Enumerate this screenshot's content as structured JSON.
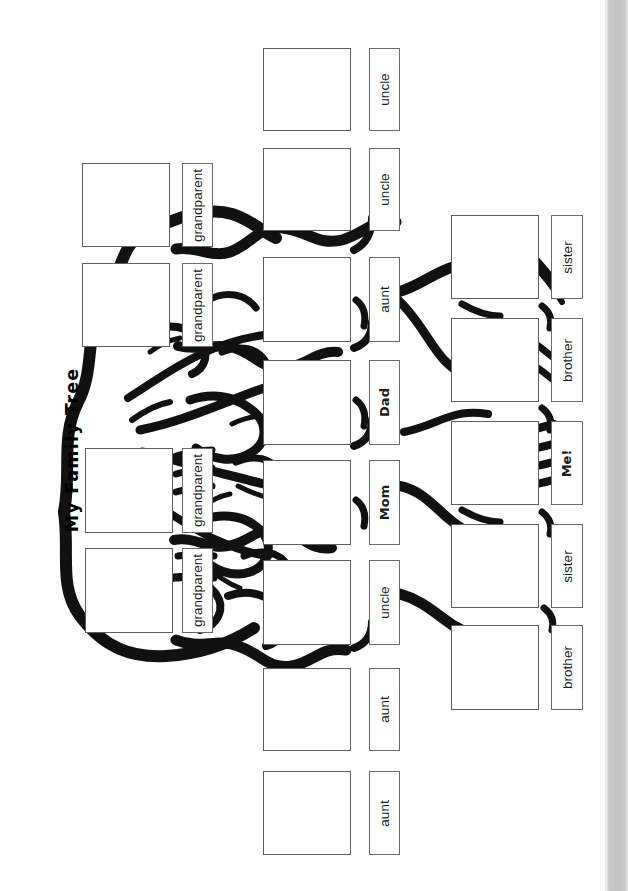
{
  "page": {
    "title": "My Family Tree",
    "doc_type": "family-tree-worksheet",
    "background_color": "#ffffff",
    "ink_color": "#000000",
    "edge_strip_color": "#c7c7c7"
  },
  "columns": {
    "grandparents": {
      "name": "grandparents-column",
      "entries": [
        {
          "label": "grandparent",
          "bold": false,
          "photo": {
            "x": 82,
            "y": 163,
            "w": 88,
            "h": 84
          },
          "tag": {
            "x": 182,
            "y": 163,
            "w": 31,
            "h": 84
          }
        },
        {
          "label": "grandparent",
          "bold": false,
          "photo": {
            "x": 82,
            "y": 263,
            "w": 88,
            "h": 84
          },
          "tag": {
            "x": 182,
            "y": 263,
            "w": 31,
            "h": 84
          }
        },
        {
          "label": "grandparent",
          "bold": false,
          "photo": {
            "x": 85,
            "y": 448,
            "w": 88,
            "h": 85
          },
          "tag": {
            "x": 182,
            "y": 448,
            "w": 31,
            "h": 85
          }
        },
        {
          "label": "grandparent",
          "bold": false,
          "photo": {
            "x": 85,
            "y": 548,
            "w": 88,
            "h": 85
          },
          "tag": {
            "x": 182,
            "y": 548,
            "w": 31,
            "h": 85
          }
        }
      ]
    },
    "parents": {
      "name": "parents-aunts-uncles-column",
      "entries": [
        {
          "label": "uncle",
          "bold": false,
          "photo": {
            "x": 263,
            "y": 48,
            "w": 88,
            "h": 83
          },
          "tag": {
            "x": 369,
            "y": 48,
            "w": 31,
            "h": 83
          }
        },
        {
          "label": "uncle",
          "bold": false,
          "photo": {
            "x": 263,
            "y": 148,
            "w": 88,
            "h": 83
          },
          "tag": {
            "x": 369,
            "y": 148,
            "w": 31,
            "h": 83
          }
        },
        {
          "label": "aunt",
          "bold": false,
          "photo": {
            "x": 263,
            "y": 257,
            "w": 88,
            "h": 85
          },
          "tag": {
            "x": 369,
            "y": 257,
            "w": 31,
            "h": 85
          }
        },
        {
          "label": "Dad",
          "bold": true,
          "photo": {
            "x": 263,
            "y": 360,
            "w": 88,
            "h": 85
          },
          "tag": {
            "x": 369,
            "y": 360,
            "w": 31,
            "h": 85
          }
        },
        {
          "label": "Mom",
          "bold": true,
          "photo": {
            "x": 263,
            "y": 460,
            "w": 88,
            "h": 85
          },
          "tag": {
            "x": 369,
            "y": 460,
            "w": 31,
            "h": 85
          }
        },
        {
          "label": "uncle",
          "bold": false,
          "photo": {
            "x": 263,
            "y": 560,
            "w": 88,
            "h": 85
          },
          "tag": {
            "x": 369,
            "y": 560,
            "w": 31,
            "h": 85
          }
        },
        {
          "label": "aunt",
          "bold": false,
          "photo": {
            "x": 263,
            "y": 668,
            "w": 88,
            "h": 83
          },
          "tag": {
            "x": 369,
            "y": 668,
            "w": 31,
            "h": 83
          }
        },
        {
          "label": "aunt",
          "bold": false,
          "photo": {
            "x": 263,
            "y": 771,
            "w": 88,
            "h": 84
          },
          "tag": {
            "x": 369,
            "y": 771,
            "w": 31,
            "h": 84
          }
        }
      ]
    },
    "siblings": {
      "name": "siblings-column",
      "entries": [
        {
          "label": "sister",
          "bold": false,
          "photo": {
            "x": 451,
            "y": 215,
            "w": 88,
            "h": 84
          },
          "tag": {
            "x": 551,
            "y": 215,
            "w": 32,
            "h": 84
          }
        },
        {
          "label": "brother",
          "bold": false,
          "photo": {
            "x": 451,
            "y": 318,
            "w": 88,
            "h": 84
          },
          "tag": {
            "x": 551,
            "y": 318,
            "w": 32,
            "h": 84
          }
        },
        {
          "label": "Me!",
          "bold": true,
          "photo": {
            "x": 451,
            "y": 421,
            "w": 88,
            "h": 84
          },
          "tag": {
            "x": 551,
            "y": 421,
            "w": 32,
            "h": 84
          }
        },
        {
          "label": "sister",
          "bold": false,
          "photo": {
            "x": 451,
            "y": 524,
            "w": 88,
            "h": 84
          },
          "tag": {
            "x": 551,
            "y": 524,
            "w": 32,
            "h": 84
          }
        },
        {
          "label": "brother",
          "bold": false,
          "photo": {
            "x": 451,
            "y": 625,
            "w": 88,
            "h": 85
          },
          "tag": {
            "x": 551,
            "y": 625,
            "w": 32,
            "h": 85
          }
        }
      ]
    }
  }
}
